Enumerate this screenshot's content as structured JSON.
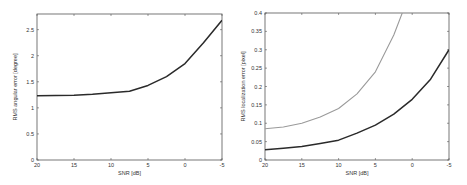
{
  "chart_data": [
    {
      "type": "line",
      "title": "",
      "xlabel": "SNR [dB]",
      "ylabel": "RMS angular error [degree]",
      "xlim": [
        20,
        -5
      ],
      "ylim": [
        0,
        2.8
      ],
      "x_reversed": true,
      "grid": false,
      "legend": null,
      "xticks": [
        20,
        15,
        10,
        5,
        0,
        -5
      ],
      "xtick_labels": [
        "20",
        "15",
        "10",
        "5",
        "0",
        "-5"
      ],
      "yticks": [
        0,
        0.5,
        1,
        1.5,
        2,
        2.5
      ],
      "ytick_labels": [
        "0",
        "0.5",
        "1",
        "1.5",
        "2",
        "2.5"
      ],
      "x": [
        20,
        17.5,
        15,
        12.5,
        10,
        7.5,
        5,
        2.5,
        0,
        -2.5,
        -5
      ],
      "series": [
        {
          "name": "angular error",
          "color": "#2a2a2a",
          "values": [
            1.23,
            1.235,
            1.24,
            1.26,
            1.29,
            1.32,
            1.43,
            1.6,
            1.85,
            2.25,
            2.68
          ]
        }
      ]
    },
    {
      "type": "line",
      "title": "",
      "xlabel": "SNR [dB]",
      "ylabel": "RMS localization error [pixel]",
      "xlim": [
        20,
        -5
      ],
      "ylim": [
        0,
        0.4
      ],
      "x_reversed": true,
      "grid": false,
      "legend": null,
      "xticks": [
        20,
        15,
        10,
        5,
        0,
        -5
      ],
      "xtick_labels": [
        "20",
        "15",
        "10",
        "5",
        "0",
        "-5"
      ],
      "yticks": [
        0,
        0.05,
        0.1,
        0.15,
        0.2,
        0.25,
        0.3,
        0.35,
        0.4
      ],
      "ytick_labels": [
        "0",
        "0.05",
        "0.1",
        "0.15",
        "0.2",
        "0.25",
        "0.3",
        "0.35",
        "0.4"
      ],
      "x": [
        20,
        17.5,
        15,
        12.5,
        10,
        7.5,
        5,
        2.5,
        0,
        -2.5,
        -5
      ],
      "series": [
        {
          "name": "gray curve",
          "color": "#9a9a9a",
          "values": [
            0.085,
            0.09,
            0.1,
            0.117,
            0.14,
            0.18,
            0.24,
            0.34,
            null,
            null,
            null
          ],
          "exits_top_at_x": 1.3
        },
        {
          "name": "black curve",
          "color": "#2a2a2a",
          "values": [
            0.028,
            0.032,
            0.037,
            0.045,
            0.054,
            0.073,
            0.095,
            0.125,
            0.165,
            0.22,
            0.3
          ]
        }
      ]
    }
  ],
  "charts": {
    "left": {
      "xlabel": "SNR [dB]",
      "ylabel": "RMS angular error [degree]"
    },
    "right": {
      "xlabel": "SNR [dB]",
      "ylabel": "RMS localization error [pixel]"
    }
  }
}
